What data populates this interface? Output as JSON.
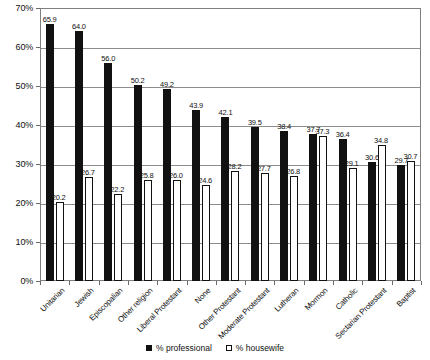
{
  "chart_data": {
    "type": "bar",
    "title": "",
    "subtitle": "",
    "xlabel": "",
    "ylabel": "",
    "ylim": [
      0,
      70
    ],
    "ytick_step": 10,
    "ytick_labels": [
      "0%",
      "10%",
      "20%",
      "30%",
      "40%",
      "50%",
      "60%",
      "70%"
    ],
    "ytick_values": [
      0,
      10,
      20,
      30,
      40,
      50,
      60,
      70
    ],
    "grid": true,
    "legend_position": "bottom-center",
    "value_labels": true,
    "categories": [
      "Unitarian",
      "Jewish",
      "Episcopalian",
      "Other religion",
      "Liberal Protestant",
      "None",
      "Other Protestant",
      "Moderate Protestant",
      "Lutheran",
      "Mormon",
      "Catholic",
      "Sectarian Protestant",
      "Baptist"
    ],
    "series": [
      {
        "name": "% professional",
        "color": "#111111",
        "style": "filled",
        "values": [
          65.9,
          64.0,
          56.0,
          50.2,
          49.2,
          43.9,
          42.1,
          39.5,
          38.4,
          37.7,
          36.4,
          30.6,
          29.7
        ],
        "labels": [
          "65.9",
          "64.0",
          "56.0",
          "50.2",
          "49.2",
          "43.9",
          "42.1",
          "39.5",
          "38.4",
          "37.7",
          "36.4",
          "30.6",
          "29.7"
        ]
      },
      {
        "name": "% housewife",
        "color": "#ffffff",
        "style": "open",
        "values": [
          20.2,
          26.7,
          22.2,
          25.8,
          26.0,
          24.6,
          28.2,
          27.7,
          26.8,
          37.3,
          29.1,
          34.8,
          30.7
        ],
        "labels": [
          "20.2",
          "26.7",
          "22.2",
          "25.8",
          "26.0",
          "24.6",
          "28.2",
          "27.7",
          "26.8",
          "37.3",
          "29.1",
          "34.8",
          "30.7"
        ]
      }
    ]
  },
  "legend": {
    "items": [
      {
        "label": "% professional",
        "style": "filled"
      },
      {
        "label": "% housewife",
        "style": "open"
      }
    ]
  },
  "colors": {
    "professional": "#111111",
    "housewife": "#ffffff",
    "outline": "#111111",
    "grid": "#8c8c8c",
    "frame": "#808080",
    "text": "#111111",
    "background": "#ffffff"
  }
}
